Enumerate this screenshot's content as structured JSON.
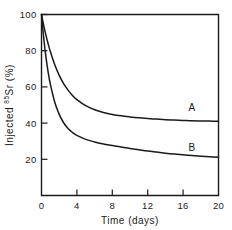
{
  "chart_data": {
    "type": "line",
    "title": "",
    "subtitle": "",
    "xlabel": "Time (days)",
    "ylabel": "Injected ⁸⁵Sr (%)",
    "ylabel_parts": {
      "prefix": "Injected ",
      "superscript": "85",
      "suffix": "Sr (%)"
    },
    "xlim": [
      0,
      20
    ],
    "ylim": [
      0,
      100
    ],
    "xticks": [
      0,
      4,
      8,
      12,
      16,
      20
    ],
    "xtick_labels": [
      "0",
      "4",
      "8",
      "12",
      "16",
      "20"
    ],
    "yticks": [
      20,
      40,
      60,
      80,
      100
    ],
    "ytick_labels": [
      "20",
      "40",
      "60",
      "80",
      "100"
    ],
    "grid": false,
    "legend_position": "inline-annotation",
    "line_color": "#1a1a1a",
    "background_color": "#ffffff",
    "axis_color": "#1a1a1a",
    "series": [
      {
        "name": "A",
        "label": "A",
        "label_x": 17.0,
        "label_y": 48.5,
        "x": [
          0,
          0.25,
          0.5,
          0.75,
          1,
          1.5,
          2,
          2.5,
          3,
          3.5,
          4,
          5,
          6,
          7,
          8,
          9,
          10,
          11,
          12,
          13,
          14,
          15,
          16,
          17,
          18,
          19,
          20
        ],
        "values": [
          100,
          94.0,
          88.6,
          83.8,
          79.5,
          72.2,
          66.4,
          61.8,
          58.2,
          55.3,
          53.0,
          49.6,
          47.4,
          45.9,
          44.8,
          44.0,
          43.4,
          42.9,
          42.5,
          42.2,
          41.9,
          41.7,
          41.5,
          41.3,
          41.2,
          41.1,
          41.0
        ]
      },
      {
        "name": "B",
        "label": "B",
        "label_x": 17.0,
        "label_y": 26.5,
        "x": [
          0,
          0.25,
          0.5,
          0.75,
          1,
          1.5,
          2,
          2.5,
          3,
          3.5,
          4,
          5,
          6,
          7,
          8,
          9,
          10,
          11,
          12,
          13,
          14,
          15,
          16,
          17,
          18,
          19,
          20
        ],
        "values": [
          100,
          87.0,
          76.6,
          68.2,
          61.5,
          51.5,
          44.8,
          40.2,
          37.0,
          34.8,
          33.2,
          31.0,
          29.6,
          28.5,
          27.6,
          26.8,
          26.0,
          25.3,
          24.6,
          24.0,
          23.4,
          22.9,
          22.5,
          22.1,
          21.7,
          21.4,
          21.1
        ]
      }
    ]
  }
}
